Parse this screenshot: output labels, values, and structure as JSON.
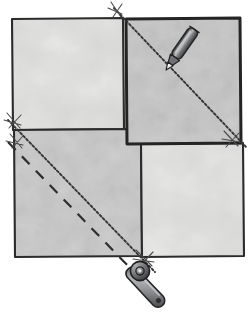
{
  "illustration": {
    "title": "Marking and cutting fabric squares on the diagonal",
    "subject": "quilting-instruction-diagram",
    "background_color": "#ffffff"
  },
  "canvas": {
    "width": 249,
    "height": 313
  },
  "palette": {
    "fabric_light": "#d3d3d2",
    "fabric_light_alt": "#d8d8d7",
    "fabric_medium": "#c3c4c3",
    "fabric_mottle_light": "#e3e3e2",
    "fabric_mottle_dark": "#bcbcbb",
    "outline_dark": "#2b2b2b",
    "stitch_line": "#3a3a3a",
    "tool_body": "#8c8d8f",
    "tool_dark": "#4a4b4d",
    "tool_highlight": "#cfd0d1",
    "pencil_tip": "#f2f2f0",
    "background": "#ffffff"
  },
  "pieces": [
    {
      "name": "top-left-fabric-square",
      "label": "Top left fabric square",
      "shade": "light",
      "x": 11,
      "y": 18,
      "width": 112,
      "height": 110
    },
    {
      "name": "top-right-fabric-square",
      "label": "Top right fabric square (placed on top, right side down)",
      "shade": "medium",
      "x": 125,
      "y": 18,
      "width": 115,
      "height": 125,
      "on_top": true
    },
    {
      "name": "bottom-left-fabric-square",
      "label": "Bottom left fabric square",
      "shade": "medium",
      "x": 13,
      "y": 129,
      "width": 128,
      "height": 128
    },
    {
      "name": "bottom-right-fabric-square",
      "label": "Bottom right fabric square",
      "shade": "light",
      "x": 140,
      "y": 144,
      "width": 103,
      "height": 113
    }
  ],
  "marked_lines": [
    {
      "name": "diagonal-marking-line-top",
      "style": "dotted",
      "label": "Drawn diagonal marking line on top right square",
      "x1": 114,
      "y1": 8,
      "x2": 247,
      "y2": 148
    },
    {
      "name": "diagonal-marking-line-bottom",
      "style": "dotted",
      "label": "Drawn diagonal marking line on bottom left square",
      "x1": 8,
      "y1": 120,
      "x2": 155,
      "y2": 272
    },
    {
      "name": "diagonal-stitch-line-bottom",
      "style": "dashed",
      "label": "Offset stitching line parallel to the diagonal",
      "x1": 8,
      "y1": 140,
      "x2": 135,
      "y2": 272
    }
  ],
  "thread_marks": [
    {
      "name": "thread-mark-top",
      "x": 117,
      "y": 10,
      "rotation": -20
    },
    {
      "name": "thread-mark-left-upper",
      "x": 12,
      "y": 122,
      "rotation": -20
    },
    {
      "name": "thread-mark-left-lower",
      "x": 14,
      "y": 142,
      "rotation": -20
    },
    {
      "name": "thread-mark-right",
      "x": 228,
      "y": 138,
      "rotation": -20
    },
    {
      "name": "thread-mark-bottom",
      "x": 141,
      "y": 258,
      "rotation": -20
    }
  ],
  "tools": [
    {
      "name": "marking-pencil",
      "label": "Marking pencil drawing the diagonal line",
      "tip_x": 170,
      "tip_y": 63,
      "angle_deg": -55,
      "body_length": 40,
      "body_width": 11,
      "icon": "pencil-icon"
    },
    {
      "name": "rotary-cutter",
      "label": "Rotary cutter resting below the fabric",
      "head_x": 140,
      "head_y": 271,
      "handle_end_x": 163,
      "handle_end_y": 300,
      "head_radius": 9,
      "icon": "rotary-cutter-icon"
    }
  ]
}
